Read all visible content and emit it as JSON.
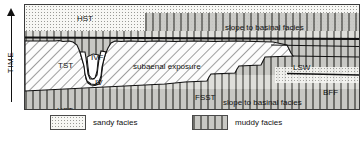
{
  "axis": {
    "label": "TIME",
    "arrow": "up-arrow-icon",
    "direction": "upward"
  },
  "diagram": {
    "labels": [
      {
        "id": "hst-upper",
        "text": "HST",
        "x": 52,
        "y": 9,
        "size": "md"
      },
      {
        "id": "slope-upper",
        "text": "slope to basinal facies",
        "x": 200,
        "y": 18,
        "size": "md"
      },
      {
        "id": "cs-1",
        "text": "CS",
        "x": 338,
        "y": 20,
        "size": "md"
      },
      {
        "id": "mfs",
        "text": "mfs",
        "x": 339,
        "y": 39,
        "size": "sm"
      },
      {
        "id": "ts",
        "text": "ts",
        "x": 340,
        "y": 47,
        "size": "xs"
      },
      {
        "id": "tst",
        "text": "TST",
        "x": 33,
        "y": 56,
        "size": "md"
      },
      {
        "id": "ivf",
        "text": "IVF",
        "x": 66,
        "y": 48,
        "size": "md"
      },
      {
        "id": "iv",
        "text": "IV",
        "x": 70,
        "y": 73,
        "size": "md"
      },
      {
        "id": "subaerial",
        "text": "subaenal exposure",
        "x": 108,
        "y": 57,
        "size": "md"
      },
      {
        "id": "lsw",
        "text": "LSW",
        "x": 268,
        "y": 58,
        "size": "md"
      },
      {
        "id": "cs-2",
        "text": "CS",
        "x": 338,
        "y": 58,
        "size": "md"
      },
      {
        "id": "cc",
        "text": "CC",
        "x": 339,
        "y": 74,
        "size": "md"
      },
      {
        "id": "bff",
        "text": "BFF",
        "x": 298,
        "y": 83,
        "size": "md"
      },
      {
        "id": "fsst",
        "text": "FSST",
        "x": 170,
        "y": 88,
        "size": "md"
      },
      {
        "id": "slope-lower",
        "text": "slope to basinal facies",
        "x": 198,
        "y": 93,
        "size": "md"
      },
      {
        "id": "cs-3",
        "text": "CS",
        "x": 338,
        "y": 101,
        "size": "md"
      },
      {
        "id": "hst-lower",
        "text": "HST",
        "x": 32,
        "y": 101,
        "size": "md"
      }
    ]
  },
  "legend": {
    "items": [
      {
        "id": "sandy",
        "label": "sandy facies",
        "pattern": "sandy",
        "x": 26
      },
      {
        "id": "muddy",
        "label": "muddy facies",
        "pattern": "muddy",
        "x": 168
      }
    ]
  },
  "colors": {
    "ink": "#111111",
    "panel_border": "#3a3a3a",
    "sandy_fill": "#f7f7f4",
    "muddy_fill": "#c8c8c4",
    "hatch_line": "#2e2e2e"
  }
}
